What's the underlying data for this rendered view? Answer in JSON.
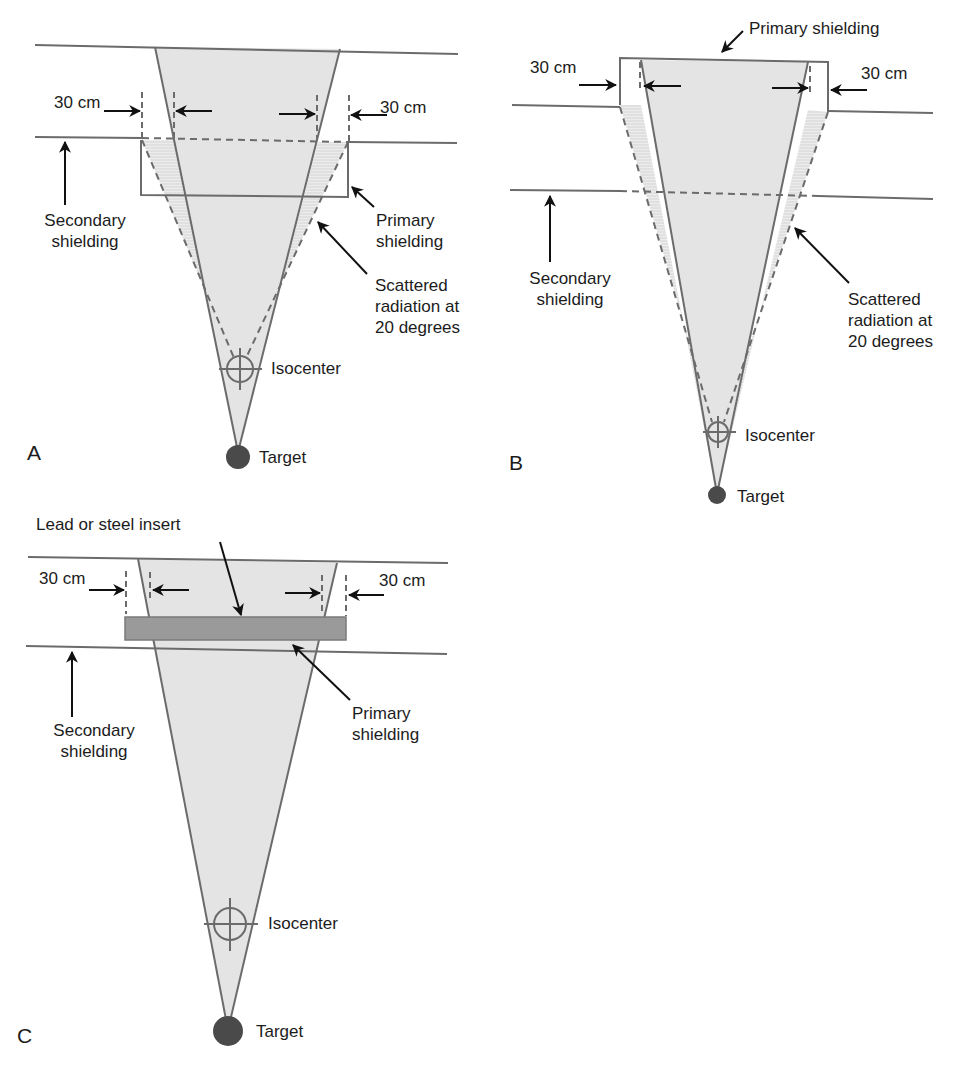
{
  "figure": {
    "colors": {
      "beam_fill": "#e4e4e4",
      "line": "#6b6b6b",
      "arrow": "#111111",
      "insert_fill": "#9a9a9a",
      "target": "#4a4a4a",
      "scatter_hatch": "#d8d8d8"
    }
  },
  "panels": [
    {
      "letter": "A",
      "margin_left": "30 cm",
      "margin_right": "30 cm",
      "secondary_label_1": "Secondary",
      "secondary_label_2": "shielding",
      "primary_label_1": "Primary",
      "primary_label_2": "shielding",
      "scatter_label_1": "Scattered",
      "scatter_label_2": "radiation at",
      "scatter_label_3": "20 degrees",
      "isocenter_label": "Isocenter",
      "target_label": "Target"
    },
    {
      "letter": "B",
      "margin_left": "30 cm",
      "margin_right": "30 cm",
      "primary_label": "Primary shielding",
      "secondary_label_1": "Secondary",
      "secondary_label_2": "shielding",
      "scatter_label_1": "Scattered",
      "scatter_label_2": "radiation at",
      "scatter_label_3": "20 degrees",
      "isocenter_label": "Isocenter",
      "target_label": "Target"
    },
    {
      "letter": "C",
      "margin_left": "30 cm",
      "margin_right": "30 cm",
      "insert_label": "Lead or steel insert",
      "secondary_label_1": "Secondary",
      "secondary_label_2": "shielding",
      "primary_label_1": "Primary",
      "primary_label_2": "shielding",
      "isocenter_label": "Isocenter",
      "target_label": "Target"
    }
  ]
}
